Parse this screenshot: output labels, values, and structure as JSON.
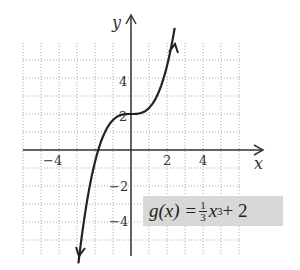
{
  "chart_data": {
    "type": "line",
    "title": "",
    "function": "g(x) = (1/3)x^3 + 2",
    "xlabel": "x",
    "ylabel": "y",
    "xlim": [
      -6,
      6
    ],
    "ylim": [
      -6,
      6
    ],
    "x_ticks": [
      -4,
      2,
      4
    ],
    "y_ticks": [
      4,
      2,
      -2,
      -4
    ],
    "grid": true,
    "series": [
      {
        "name": "g(x)",
        "x": [
          -3.1,
          -3,
          -2.5,
          -2,
          -1.5,
          -1,
          -0.5,
          0,
          0.5,
          1,
          1.5,
          2,
          2.5
        ],
        "values": [
          -7.93,
          -7,
          -3.21,
          -0.67,
          0.88,
          1.67,
          1.96,
          2,
          2.04,
          2.33,
          3.13,
          4.67,
          7.21
        ]
      }
    ]
  },
  "labels": {
    "x_axis": "x",
    "y_axis": "y",
    "tick_x_neg4": "−4",
    "tick_x_2": "2",
    "tick_x_4": "4",
    "tick_y_4": "4",
    "tick_y_2": "2",
    "tick_y_neg2": "−2",
    "tick_y_neg4": "−4"
  },
  "equation": {
    "lhs": "g(x) = ",
    "frac_num": "1",
    "frac_den": "3",
    "var": "x",
    "exp": "3",
    "rest": " + 2"
  }
}
